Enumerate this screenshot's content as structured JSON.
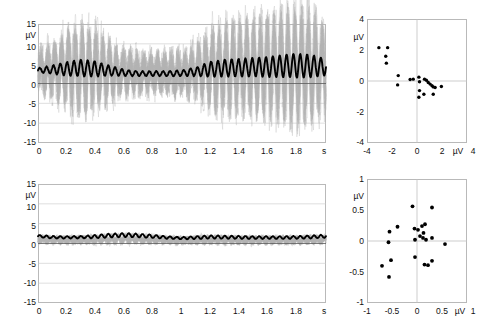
{
  "figure": {
    "panels": [
      "top-left-timeseries",
      "top-right-scatter",
      "bottom-left-timeseries",
      "bottom-right-scatter"
    ],
    "background": "#ffffff",
    "trace_color": "#000000",
    "trial_color": "#b4b4b4",
    "grid_color": "#c3c3c3"
  },
  "chart_data": [
    {
      "id": "top-left",
      "type": "line",
      "title": "",
      "xlabel": "s",
      "ylabel": "µV",
      "xlim": [
        0,
        2
      ],
      "ylim": [
        -15,
        15
      ],
      "grid": true,
      "xticks": [
        0,
        0.2,
        0.4,
        0.6,
        0.8,
        1.0,
        1.2,
        1.4,
        1.6,
        1.8
      ],
      "xticklabels": [
        "0",
        "0.2",
        "0.4",
        "0.6",
        "0.8",
        "1.0",
        "1.2",
        "1.4",
        "1.6",
        "1.8"
      ],
      "yticks": [
        -15,
        -10,
        -5,
        0,
        5,
        10,
        15
      ],
      "yticklabels": [
        "-15",
        "-10",
        "-5",
        "0",
        "5",
        "10",
        "15"
      ],
      "x_unit_label": "s",
      "y_unit_label": "µV",
      "series": [
        {
          "name": "average",
          "style": "thick-black",
          "description": "Oscillatory average evoked response riding on a ~3 uV offset; amplitude waxes to ~2 uV peak-to-peak near 0.25-0.45 s, dips to a minimum near 0.6-1.05 s, then grows strongly after 1.1 s reaching ~7 uV peaks by 1.75-1.95 s.",
          "baseline": 3.0,
          "envelope_x": [
            0.0,
            0.1,
            0.2,
            0.3,
            0.4,
            0.5,
            0.6,
            0.7,
            0.8,
            0.9,
            1.0,
            1.1,
            1.2,
            1.3,
            1.4,
            1.5,
            1.6,
            1.7,
            1.8,
            1.9,
            2.0
          ],
          "envelope_amp": [
            0.55,
            1.0,
            1.7,
            2.1,
            1.9,
            1.2,
            0.75,
            0.6,
            0.6,
            0.62,
            0.7,
            1.1,
            1.9,
            2.1,
            2.2,
            2.3,
            2.5,
            2.8,
            3.0,
            2.8,
            2.0
          ],
          "envelope_mean": [
            3.3,
            3.5,
            3.7,
            3.9,
            3.7,
            3.2,
            2.7,
            2.5,
            2.5,
            2.5,
            2.6,
            3.0,
            3.6,
            3.9,
            4.0,
            4.1,
            4.2,
            4.4,
            4.5,
            4.4,
            4.1
          ],
          "frequency_hz": 21
        },
        {
          "name": "single-trials",
          "style": "thin-gray",
          "description": "Overlaid single-trial traces spanning roughly -11 to +11 uV, densest between -8 and +8 uV.",
          "spread": [
            -11,
            11
          ]
        }
      ]
    },
    {
      "id": "top-right",
      "type": "scatter",
      "title": "",
      "xlabel": "µV",
      "ylabel": "µV",
      "xlim": [
        -4,
        4
      ],
      "ylim": [
        -4,
        4
      ],
      "grid": true,
      "xticks": [
        -4,
        -2,
        0,
        2,
        4
      ],
      "xticklabels": [
        "-4",
        "-2",
        "0",
        "2",
        "4"
      ],
      "yticks": [
        -4,
        -2,
        0,
        2,
        4
      ],
      "yticklabels": [
        "-4",
        "-2",
        "0",
        "2",
        "4"
      ],
      "x_unit_label": "µV",
      "y_unit_label": "µV",
      "points": [
        [
          -3.05,
          2.15
        ],
        [
          -2.35,
          2.15
        ],
        [
          -2.5,
          1.6
        ],
        [
          -2.45,
          1.15
        ],
        [
          -1.5,
          0.35
        ],
        [
          -1.55,
          -0.25
        ],
        [
          -0.55,
          0.1
        ],
        [
          -0.3,
          0.12
        ],
        [
          0.15,
          0.25
        ],
        [
          0.2,
          -0.05
        ],
        [
          0.6,
          0.12
        ],
        [
          0.75,
          0.05
        ],
        [
          0.9,
          -0.1
        ],
        [
          1.05,
          -0.2
        ],
        [
          1.2,
          -0.3
        ],
        [
          1.3,
          -0.38
        ],
        [
          1.45,
          -0.42
        ],
        [
          1.95,
          -0.35
        ],
        [
          0.2,
          -0.62
        ],
        [
          0.55,
          -0.85
        ],
        [
          0.15,
          -1.05
        ],
        [
          1.3,
          -0.85
        ]
      ]
    },
    {
      "id": "bottom-left",
      "type": "line",
      "title": "",
      "xlabel": "s",
      "ylabel": "µV",
      "xlim": [
        0,
        2
      ],
      "ylim": [
        -15,
        15
      ],
      "grid": true,
      "xticks": [
        0,
        0.2,
        0.4,
        0.6,
        0.8,
        1.0,
        1.2,
        1.4,
        1.6,
        1.8
      ],
      "xticklabels": [
        "0",
        "0.2",
        "0.4",
        "0.6",
        "0.8",
        "1",
        "1.2",
        "1.4",
        "1.6",
        "1.8"
      ],
      "yticks": [
        -15,
        -10,
        -5,
        0,
        5,
        10,
        15
      ],
      "yticklabels": [
        "-15",
        "-10",
        "-5",
        "0",
        "5",
        "10",
        "15"
      ],
      "x_unit_label": "s",
      "y_unit_label": "µV",
      "series": [
        {
          "name": "average",
          "style": "thick-black",
          "description": "Low-amplitude average near 1.5-2 uV with small ripple; broad gentle hump peaking around 0.55-0.7 s, flat thereafter.",
          "baseline": 1.6,
          "envelope_x": [
            0.0,
            0.1,
            0.2,
            0.3,
            0.4,
            0.5,
            0.6,
            0.7,
            0.8,
            0.9,
            1.0,
            1.1,
            1.2,
            1.3,
            1.4,
            1.5,
            1.6,
            1.7,
            1.8,
            1.9,
            2.0
          ],
          "envelope_amp": [
            0.3,
            0.3,
            0.28,
            0.3,
            0.4,
            0.48,
            0.5,
            0.45,
            0.4,
            0.3,
            0.28,
            0.35,
            0.4,
            0.38,
            0.36,
            0.34,
            0.33,
            0.33,
            0.34,
            0.36,
            0.38
          ],
          "envelope_mean": [
            1.85,
            1.6,
            1.55,
            1.6,
            1.75,
            2.0,
            2.15,
            2.0,
            1.8,
            1.5,
            1.35,
            1.5,
            1.65,
            1.6,
            1.55,
            1.5,
            1.5,
            1.5,
            1.55,
            1.65,
            1.85
          ],
          "frequency_hz": 21
        },
        {
          "name": "single-trials",
          "style": "thin-gray",
          "description": "Overlaid single-trial traces confined to roughly -2.5 to +3.5 uV, much tighter than the top panel.",
          "spread": [
            -2.5,
            3.5
          ]
        }
      ]
    },
    {
      "id": "bottom-right",
      "type": "scatter",
      "title": "",
      "xlabel": "µV",
      "ylabel": "µV",
      "xlim": [
        -1,
        1
      ],
      "ylim": [
        -1,
        1
      ],
      "grid": true,
      "xticks": [
        -1,
        -0.5,
        0,
        0.5,
        1
      ],
      "xticklabels": [
        "-1",
        "-0.5",
        "0",
        "0.5",
        "1"
      ],
      "yticks": [
        -1,
        -0.5,
        0,
        0.5,
        1
      ],
      "yticklabels": [
        "-1",
        "-0.5",
        "0",
        "0.5",
        "1"
      ],
      "x_unit_label": "µV",
      "y_unit_label": "µV",
      "points": [
        [
          -0.09,
          0.56
        ],
        [
          0.3,
          0.54
        ],
        [
          -0.55,
          0.15
        ],
        [
          -0.39,
          0.23
        ],
        [
          -0.57,
          -0.02
        ],
        [
          -0.05,
          0.2
        ],
        [
          0.02,
          0.18
        ],
        [
          0.1,
          0.24
        ],
        [
          0.16,
          0.27
        ],
        [
          0.13,
          0.13
        ],
        [
          0.06,
          0.08
        ],
        [
          0.12,
          0.05
        ],
        [
          0.18,
          0.02
        ],
        [
          0.3,
          0.05
        ],
        [
          -0.04,
          0.02
        ],
        [
          0.56,
          -0.05
        ],
        [
          -0.7,
          -0.4
        ],
        [
          -0.52,
          -0.31
        ],
        [
          -0.56,
          -0.58
        ],
        [
          -0.04,
          -0.26
        ],
        [
          0.15,
          -0.38
        ],
        [
          0.3,
          -0.32
        ],
        [
          0.22,
          -0.39
        ]
      ]
    }
  ]
}
